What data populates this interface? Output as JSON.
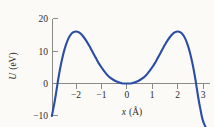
{
  "chart_data": {
    "type": "line",
    "title": "",
    "subtitle": "",
    "xlabel": "x (Å)",
    "ylabel": "U (eV)",
    "xlabel_symbol": "x",
    "xlabel_unit": "(Å)",
    "ylabel_symbol": "U",
    "ylabel_unit": "(eV)",
    "xlim": [
      -2.95,
      3.25
    ],
    "ylim": [
      -10,
      20
    ],
    "grid": false,
    "legend": null,
    "legend_position": "none",
    "series": [
      {
        "name": "U(x)",
        "color": "#2a4da6",
        "x": [
          -2.95,
          -2.9,
          -2.85,
          -2.8,
          -2.75,
          -2.7,
          -2.6,
          -2.5,
          -2.4,
          -2.3,
          -2.2,
          -2.1,
          -2.0,
          -1.9,
          -1.8,
          -1.7,
          -1.6,
          -1.5,
          -1.4,
          -1.3,
          -1.2,
          -1.1,
          -1.0,
          -0.9,
          -0.8,
          -0.7,
          -0.6,
          -0.5,
          -0.4,
          -0.3,
          -0.2,
          -0.1,
          0.0,
          0.1,
          0.2,
          0.3,
          0.4,
          0.5,
          0.6,
          0.7,
          0.8,
          0.9,
          1.0,
          1.1,
          1.2,
          1.3,
          1.4,
          1.5,
          1.6,
          1.7,
          1.8,
          1.9,
          2.0,
          2.1,
          2.2,
          2.3,
          2.4,
          2.5,
          2.6,
          2.7,
          2.75,
          2.8,
          2.85,
          2.9,
          2.95,
          3.0,
          3.05,
          3.1,
          3.15,
          3.2,
          3.25
        ],
        "y": [
          -10.0,
          -8.0,
          -6.0,
          -3.7,
          -1.2,
          1.3,
          5.6,
          9.1,
          11.8,
          13.8,
          15.1,
          15.8,
          16.0,
          15.8,
          15.2,
          14.3,
          13.2,
          11.9,
          10.5,
          9.0,
          7.6,
          6.2,
          5.0,
          3.9,
          2.9,
          2.1,
          1.5,
          1.0,
          0.6,
          0.3,
          0.1,
          0.02,
          0.0,
          0.02,
          0.1,
          0.3,
          0.6,
          1.0,
          1.5,
          2.1,
          2.9,
          3.9,
          5.0,
          6.2,
          7.6,
          9.0,
          10.5,
          11.9,
          13.2,
          14.3,
          15.2,
          15.8,
          16.0,
          15.8,
          15.1,
          13.8,
          11.8,
          9.1,
          5.6,
          1.3,
          -1.2,
          -3.7,
          -6.0,
          -8.0,
          -10.0,
          -11.5,
          -12.5,
          -13.4,
          -14.2,
          -15.0,
          -15.8
        ]
      }
    ],
    "x_ticks": [
      -2,
      -1,
      0,
      1,
      2,
      3
    ],
    "x_tick_labels": [
      "−2",
      "−1",
      "0",
      "1",
      "2",
      "3"
    ],
    "y_ticks": [
      -10,
      0,
      10,
      20
    ],
    "y_tick_labels": [
      "−10",
      "0",
      "10",
      "20"
    ],
    "annotations": [],
    "notes": {
      "shape": "symmetric double-barrier potential with minimum U=0 at x=0 and two maxima of about 16 eV at x=±2",
      "peak_value": 16,
      "peak_positions": [
        -2,
        2
      ],
      "minimum_value": 0,
      "minimum_position": 0
    }
  }
}
